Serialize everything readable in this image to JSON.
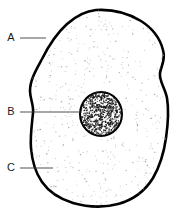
{
  "diagram": {
    "background_color": "#ffffff",
    "outline_color": "#000000",
    "leader_color": "#3c3c3c",
    "cytoplasm_dot_color": "#9a9a9a",
    "nucleus_dot_color": "#141414",
    "width": 177,
    "height": 222
  },
  "labels": [
    {
      "id": "label-a",
      "text": "A",
      "text_x": 11,
      "text_y": 38,
      "line_x1": 20,
      "line_y1": 38,
      "line_x2": 46,
      "line_y2": 38,
      "points_to": "cell-membrane"
    },
    {
      "id": "label-b",
      "text": "B",
      "text_x": 11,
      "text_y": 112,
      "line_x1": 20,
      "line_y1": 112,
      "line_x2": 82,
      "line_y2": 112,
      "points_to": "nucleus"
    },
    {
      "id": "label-c",
      "text": "C",
      "text_x": 11,
      "text_y": 168,
      "line_x1": 20,
      "line_y1": 168,
      "line_x2": 53,
      "line_y2": 168,
      "points_to": "cytoplasm"
    }
  ],
  "structures": {
    "membrane_path": "M 96 10 C 112 9 128 13 141 21 C 152 28 160 38 163 50 C 166 60 161 66 160 73 C 159 81 165 88 167 98 C 169 110 168 124 166 138 C 164 152 160 166 153 178 C 145 191 133 200 118 204 C 103 208 87 207 73 203 C 60 199 49 192 42 182 C 35 172 32 160 31 148 C 30 136 32 124 33 113 C 34 105 30 99 30 91 C 30 80 36 70 42 59 C 48 47 56 34 67 24 C 76 16 86 11 96 10 Z",
    "nucleus": {
      "cx": 101,
      "cy": 114,
      "rx": 21,
      "ry": 22
    }
  }
}
